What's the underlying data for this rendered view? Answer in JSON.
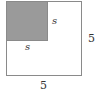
{
  "diagram": {
    "outer_square": {
      "side_label": "5",
      "right_label": "5",
      "bottom_label": "5"
    },
    "inner_square": {
      "side_label": "s",
      "right_label": "s",
      "bottom_label": "s",
      "fill": "#9a9a9a"
    }
  }
}
